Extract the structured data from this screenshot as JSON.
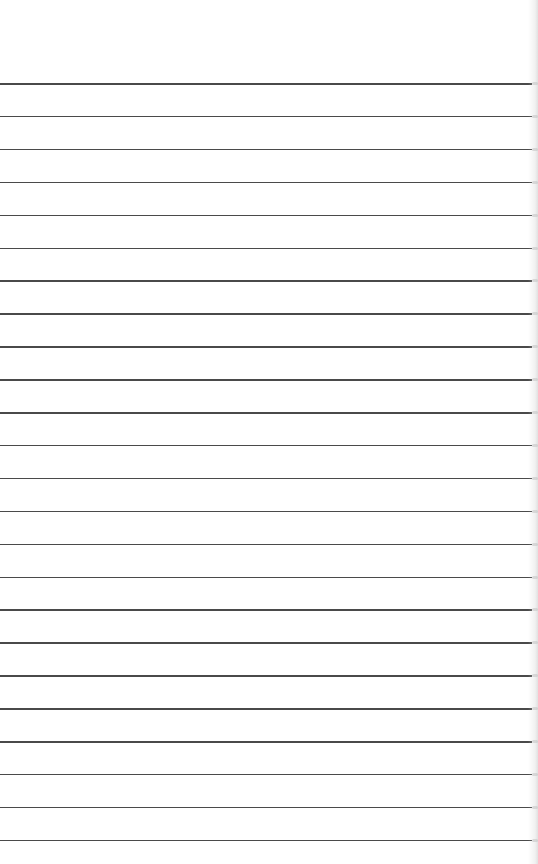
{
  "page": {
    "type": "lined-paper",
    "background_color": "#ffffff",
    "line_color": "#4a4a4a",
    "line_count": 24,
    "first_line_y": 83,
    "line_spacing": 32.9,
    "text": ""
  }
}
